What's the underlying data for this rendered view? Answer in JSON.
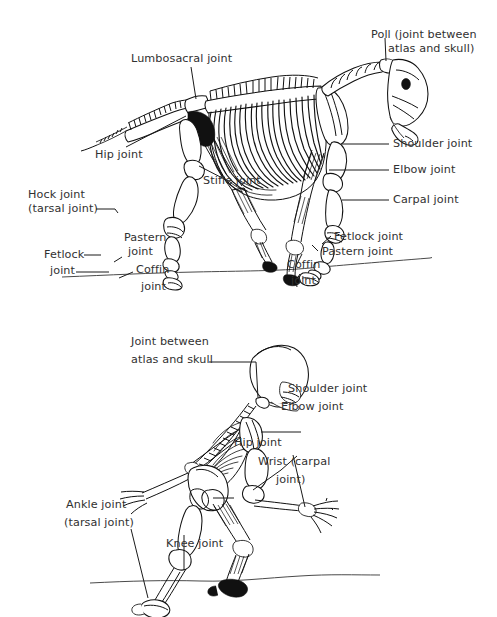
{
  "document": {
    "type": "anatomical-diagram",
    "subject": "Joints of the horse and human skeleton",
    "background_color": "#ffffff",
    "ink_color": "#111111",
    "text_color": "#313131"
  },
  "figures": [
    {
      "id": "horse-skeleton",
      "name": "Horse skeleton lateral view with joint labels",
      "labels": [
        {
          "id": "lumbosacral",
          "text": "Lumbosacral joint"
        },
        {
          "id": "poll-line1",
          "text": "Poll (joint between"
        },
        {
          "id": "poll-line2",
          "text": "atlas and skull)"
        },
        {
          "id": "hip",
          "text": "Hip joint"
        },
        {
          "id": "shoulder",
          "text": "Shoulder joint"
        },
        {
          "id": "elbow",
          "text": "Elbow joint"
        },
        {
          "id": "stifle",
          "text": "Stifle joint"
        },
        {
          "id": "carpal",
          "text": "Carpal joint"
        },
        {
          "id": "hock-line1",
          "text": "Hock joint"
        },
        {
          "id": "hock-line2",
          "text": "(tarsal joint)"
        },
        {
          "id": "pastern-hind-l1",
          "text": "Pastern"
        },
        {
          "id": "pastern-hind-l2",
          "text": "joint"
        },
        {
          "id": "fetlock-hind-l1",
          "text": "Fetlock"
        },
        {
          "id": "fetlock-hind-l2",
          "text": "joint"
        },
        {
          "id": "coffin-hind-l1",
          "text": "Coffin"
        },
        {
          "id": "coffin-hind-l2",
          "text": "joint"
        },
        {
          "id": "fetlock-fore",
          "text": "Fetlock joint"
        },
        {
          "id": "pastern-fore",
          "text": "Pastern joint"
        },
        {
          "id": "coffin-fore-l1",
          "text": "Coffin"
        },
        {
          "id": "coffin-fore-l2",
          "text": "joint"
        }
      ]
    },
    {
      "id": "human-skeleton",
      "name": "Human skeleton in quadruped stance with joint labels",
      "labels": [
        {
          "id": "atlas-skull-l1",
          "text": "Joint between"
        },
        {
          "id": "atlas-skull-l2",
          "text": "atlas and skull"
        },
        {
          "id": "shoulder",
          "text": "Shoulder joint"
        },
        {
          "id": "elbow",
          "text": "Elbow joint"
        },
        {
          "id": "hip",
          "text": "Hip joint"
        },
        {
          "id": "wrist-l1",
          "text": "Wrist (carpal"
        },
        {
          "id": "wrist-l2",
          "text": "joint)"
        },
        {
          "id": "ankle-l1",
          "text": "Ankle joint"
        },
        {
          "id": "ankle-l2",
          "text": "(tarsal joint)"
        },
        {
          "id": "knee",
          "text": "Knee joint"
        }
      ]
    }
  ]
}
